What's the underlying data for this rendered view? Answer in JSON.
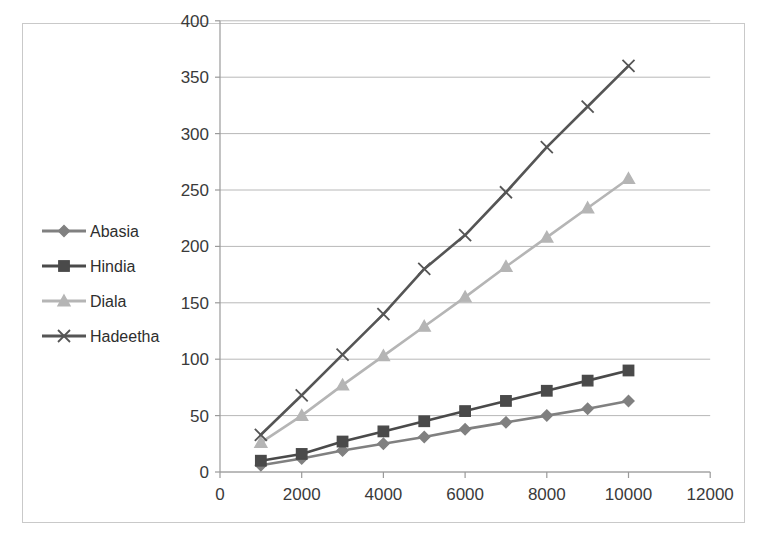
{
  "chart": {
    "title": "",
    "border_color": "#c9c9c9",
    "plot_background": "#ffffff",
    "gridline_color": "#b8b8b8",
    "axis_color": "#9a9a9a"
  },
  "chart_data": {
    "type": "line",
    "title": "",
    "xlabel": "",
    "ylabel": "",
    "xlim": [
      0,
      12000
    ],
    "ylim": [
      0,
      400
    ],
    "x_ticks": [
      "0",
      "2000",
      "4000",
      "6000",
      "8000",
      "10000",
      "12000"
    ],
    "x_tick_values": [
      0,
      2000,
      4000,
      6000,
      8000,
      10000,
      12000
    ],
    "y_ticks": [
      "0",
      "50",
      "100",
      "150",
      "200",
      "250",
      "300",
      "350",
      "400"
    ],
    "y_tick_values": [
      0,
      50,
      100,
      150,
      200,
      250,
      300,
      350,
      400
    ],
    "grid": true,
    "grid_axis": "y",
    "legend_position": "left-inside",
    "x": [
      1000,
      2000,
      3000,
      4000,
      5000,
      6000,
      7000,
      8000,
      9000,
      10000
    ],
    "series": [
      {
        "name": "Abasia",
        "marker": "diamond",
        "color": "#808080",
        "values": [
          6,
          12,
          19,
          25,
          31,
          38,
          44,
          50,
          56,
          63
        ]
      },
      {
        "name": "Hindia",
        "marker": "square",
        "color": "#4a4a4a",
        "values": [
          10,
          16,
          27,
          36,
          45,
          54,
          63,
          72,
          81,
          90
        ]
      },
      {
        "name": "Diala",
        "marker": "triangle",
        "color": "#b5b5b5",
        "values": [
          26,
          50,
          77,
          103,
          129,
          155,
          182,
          208,
          234,
          260
        ]
      },
      {
        "name": "Hadeetha",
        "marker": "x",
        "color": "#555555",
        "values": [
          33,
          68,
          104,
          140,
          180,
          210,
          248,
          288,
          324,
          360
        ]
      }
    ]
  },
  "legend": {
    "items": [
      {
        "label": "Abasia"
      },
      {
        "label": "Hindia"
      },
      {
        "label": "Diala"
      },
      {
        "label": "Hadeetha"
      }
    ]
  }
}
